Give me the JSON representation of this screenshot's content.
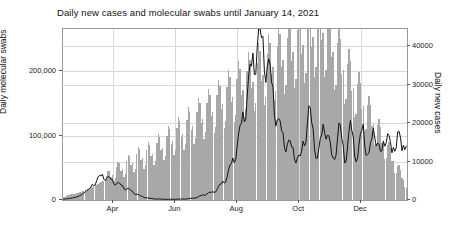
{
  "chart_data": {
    "type": "bar",
    "title": "Daily new cases and molecular swabs until January 14, 2021",
    "xlabel": "",
    "ylabel": "Daily molecular swabs",
    "y2label": "Daily new cases",
    "grid": true,
    "legend": "none",
    "x_axis": {
      "type": "date",
      "start": "2020-02-24",
      "end": "2021-01-14",
      "tick_labels": [
        "Apr",
        "Jun",
        "Aug",
        "Oct",
        "Dec"
      ],
      "tick_positions_frac": [
        0.1465,
        0.3265,
        0.5066,
        0.6866,
        0.8667
      ]
    },
    "ylim": [
      0,
      265000
    ],
    "yticks": [
      0,
      100000,
      200000
    ],
    "ytick_labels": [
      "0",
      "100,000",
      "200,000"
    ],
    "y2lim": [
      0,
      44400
    ],
    "y2ticks": [
      0,
      10000,
      20000,
      30000,
      40000
    ],
    "y2tick_labels": [
      "0",
      "10000",
      "20000",
      "30000",
      "40000"
    ],
    "series": [
      {
        "name": "Daily molecular swabs",
        "type": "bar",
        "axis": "left",
        "color": "#a8a8a8",
        "values": [
          4300,
          5200,
          6000,
          7200,
          8100,
          9200,
          9100,
          8700,
          9600,
          10500,
          11200,
          12100,
          13000,
          13800,
          14600,
          15300,
          16100,
          17200,
          18500,
          19400,
          20100,
          21000,
          22500,
          23800,
          25100,
          26400,
          27800,
          28900,
          30200,
          31500,
          33000,
          34600,
          36200,
          37900,
          39600,
          41200,
          42900,
          44100,
          45300,
          46200,
          47100,
          48000,
          49200,
          50600,
          52000,
          53500,
          55000,
          56400,
          57600,
          58900,
          60100,
          61500,
          62800,
          63900,
          64800,
          65600,
          66500,
          67400,
          68200,
          69100,
          70000,
          71000,
          72200,
          73500,
          75000,
          76400,
          77800,
          79200,
          80600,
          82000,
          83500,
          85000,
          86500,
          88000,
          89500,
          91000,
          92600,
          94200,
          95800,
          97400,
          99000,
          100600,
          102200,
          103800,
          105400,
          107000,
          108600,
          110200,
          111800,
          113400,
          115000,
          116600,
          118200,
          119800,
          121400,
          123000,
          124600,
          126200,
          127800,
          129400,
          131000,
          132600,
          134200,
          135800,
          137400,
          139000,
          140600,
          142200,
          143800,
          145400,
          147000,
          148600,
          150200,
          151800,
          153400,
          155000,
          156600,
          158200,
          159800,
          161400,
          163000,
          164600,
          166200,
          167800,
          169400,
          171000,
          172600,
          174200,
          175800,
          177400,
          179000,
          180600,
          182200,
          183800,
          185400,
          187000,
          188600,
          190200,
          191800,
          193400,
          195000,
          196600,
          198200,
          199800,
          201400,
          203000,
          204600,
          206200,
          207800,
          209400,
          211000,
          212600,
          214200,
          215800,
          217400,
          219000,
          220600,
          222200,
          223800,
          225400,
          227000,
          228600,
          230200,
          231800,
          233400,
          235000,
          236600,
          238200,
          239800,
          241400,
          243000,
          244600,
          246200,
          247800,
          249400,
          251000,
          252600,
          254200,
          255800,
          257400,
          259000,
          255000,
          251000,
          247000,
          243000,
          239000,
          235000,
          231000,
          227000,
          223000,
          219000,
          215000,
          211000,
          207000,
          203000,
          199000,
          195000,
          191000,
          187000,
          183000,
          179000,
          175000,
          171000,
          167000,
          163000,
          159000,
          155000,
          151000,
          147000,
          143000,
          139000,
          135000,
          131000,
          127000,
          123000,
          119000,
          115000,
          111000,
          107000,
          103000,
          99000,
          95000,
          91000,
          87000,
          83000,
          79000,
          75000,
          71000,
          67000,
          63000,
          59000,
          55000,
          51000,
          47000,
          43000,
          39000,
          35000,
          31000,
          27000,
          23000
        ]
      },
      {
        "name": "Daily new cases",
        "type": "line",
        "axis": "right",
        "color": "#111111",
        "values": [
          200,
          250,
          300,
          350,
          400,
          450,
          500,
          600,
          700,
          800,
          900,
          1100,
          1300,
          1500,
          1800,
          2100,
          2400,
          2700,
          3000,
          3400,
          3800,
          4200,
          4600,
          5000,
          5400,
          5700,
          6000,
          6200,
          6100,
          5900,
          5700,
          5500,
          5300,
          5100,
          4900,
          4700,
          4500,
          4300,
          4100,
          3900,
          3700,
          3500,
          3300,
          3100,
          2900,
          2700,
          2500,
          2300,
          2100,
          1900,
          1700,
          1500,
          1300,
          1100,
          950,
          850,
          750,
          650,
          550,
          480,
          420,
          380,
          340,
          300,
          280,
          260,
          240,
          230,
          220,
          210,
          200,
          195,
          190,
          185,
          180,
          180,
          185,
          190,
          195,
          200,
          210,
          220,
          230,
          240,
          250,
          270,
          290,
          320,
          350,
          400,
          450,
          520,
          600,
          700,
          800,
          950,
          1100,
          1250,
          1400,
          1500,
          1600,
          1700,
          1800,
          1900,
          2000,
          2200,
          2500,
          2800,
          3200,
          3600,
          4000,
          4500,
          5000,
          5500,
          6000,
          7000,
          8000,
          9000,
          10000,
          11000,
          12500,
          14000,
          15500,
          17000,
          19000,
          21000,
          23000,
          25000,
          27000,
          29000,
          31000,
          33000,
          35000,
          37000,
          39000,
          40000,
          41000,
          40500,
          40000,
          39000,
          38000,
          36500,
          35000,
          33000,
          31000,
          29000,
          27000,
          25000,
          23000,
          21000,
          19000,
          18000,
          17000,
          16000,
          15500,
          15000,
          14500,
          14000,
          13500,
          13000,
          12500,
          12000,
          11500,
          11000,
          10500,
          10000,
          12000,
          14000,
          16000,
          18000,
          20000,
          22000,
          21000,
          19000,
          17000,
          15000,
          13000,
          11000,
          12000,
          14000,
          16000,
          18000,
          20000,
          19000,
          17000,
          15000,
          13000,
          11000,
          10000,
          12000,
          14000,
          16000,
          18000,
          17000,
          15000,
          13000,
          11000,
          12000,
          14000,
          16000,
          18000,
          17000,
          15000,
          13000,
          12000,
          11000,
          13000,
          15000,
          17000,
          18000,
          16000,
          14000,
          12000,
          11000,
          13000,
          15000,
          17000,
          18500,
          17000,
          15000,
          13000,
          11000,
          12000,
          14000,
          16000,
          18000,
          17500,
          15000,
          13000,
          11500,
          12500,
          14500,
          16500,
          18000,
          16000,
          14000,
          12000,
          13000,
          15000,
          17000
        ]
      }
    ]
  }
}
